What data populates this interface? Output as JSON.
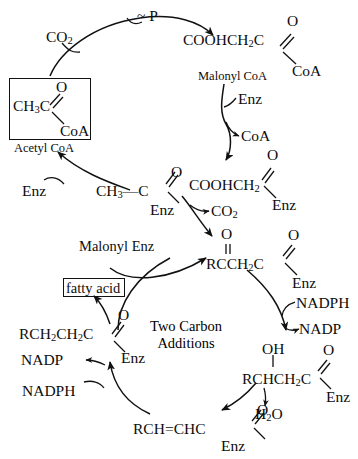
{
  "diagram": {
    "center_label_line1": "Two Carbon",
    "center_label_line2": "Additions",
    "boxes": {
      "acetyl_coa_caption": "Acetyl CoA",
      "fatty_acid": "fatty acid"
    },
    "colors": {
      "ink": "#0d0d0d",
      "background": "#ffffff",
      "box_border": "#111111"
    },
    "species": {
      "co2_top": "CO",
      "co2_top_sub": "2",
      "phosphate": "~ P",
      "malonyl_coa_label": "Malonyl CoA",
      "malonyl_enz_label": "Malonyl Enz",
      "enz_1": "Enz",
      "enz_2": "Enz",
      "enz_3": "Enz",
      "enz_4": "Enz",
      "enz_5": "Enz",
      "enz_6": "Enz",
      "enz_7": "Enz",
      "enz_8": "Enz",
      "coa_released": "CoA",
      "co2_released": "CO",
      "co2_released_sub": "2",
      "nadph_right": "NADPH",
      "nadp_right": "NADP",
      "nadph_left": "NADPH",
      "nadp_left": "NADP",
      "water": "H",
      "water_sub": "2",
      "water_tail": "O",
      "hydroxyl": "OH",
      "oxygen": "O"
    },
    "structures": {
      "acetyl_coa": {
        "chain": "CH",
        "chain_sub": "3",
        "chain_tail": "C",
        "carbonyl": "O",
        "thiol": "CoA"
      },
      "malonyl_coa": {
        "chain": "COOHCH",
        "chain_sub": "2",
        "chain_tail": "C",
        "carbonyl": "O",
        "thiol": "CoA"
      },
      "acetyl_enz": {
        "chain": "CH",
        "chain_sub": "3",
        "chain_tail": "C",
        "bond": "—",
        "carbonyl": "O",
        "thiol": "Enz"
      },
      "malonyl_enz": {
        "chain": "COOHCH",
        "chain_sub": "2",
        "carbonyl": "O",
        "thiol": "Enz"
      },
      "ketoacyl_enz": {
        "chain": "RCCH",
        "chain_sub": "2",
        "chain_tail": "C",
        "carbonyl_top": "O",
        "carbonyl_right": "O",
        "thiol": "Enz"
      },
      "hydroxyacyl_enz": {
        "hydroxyl": "OH",
        "chain": "RCHCH",
        "chain_sub": "2",
        "chain_tail": "C",
        "carbonyl": "O",
        "thiol": "Enz"
      },
      "enoyl_enz": {
        "chain": "RCH",
        "double_bond": "=",
        "chain_tail": "CHC",
        "carbonyl": "O",
        "thiol": "Enz"
      },
      "acyl_enz": {
        "chain": "RCH",
        "chain_sub1": "2",
        "chain_mid": "CH",
        "chain_sub2": "2",
        "chain_tail": "C",
        "carbonyl": "O",
        "thiol": "Enz"
      }
    }
  }
}
